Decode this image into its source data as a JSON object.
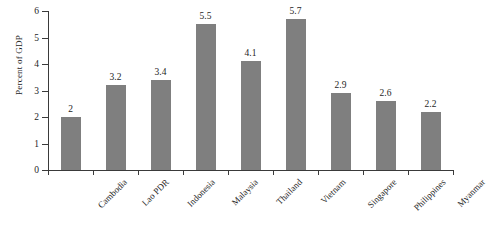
{
  "chart_data": {
    "type": "bar",
    "title": "",
    "subtitle": "",
    "xlabel": "",
    "ylabel": "Percent of GDP",
    "ylim": [
      0,
      6
    ],
    "ytick_labels": [
      "0",
      "1",
      "2",
      "3",
      "4",
      "5",
      "6"
    ],
    "yticks": [
      0,
      1,
      2,
      3,
      4,
      5,
      6
    ],
    "grid": false,
    "legend": null,
    "bar_color": "#7f7f7f",
    "axis_color": "#3a3a3a",
    "background": "#ffffff",
    "value_labels_shown": true,
    "categories": [
      "Cambodia",
      "Lao PDR",
      "Indonesia",
      "Malaysia",
      "Thailand",
      "Vietnam",
      "Singapore",
      "Philippines",
      "Myanmar"
    ],
    "values": [
      2,
      3.2,
      3.4,
      5.5,
      4.1,
      5.7,
      2.9,
      2.6,
      2.2
    ],
    "value_label_text": [
      "2",
      "3.2",
      "3.4",
      "5.5",
      "4.1",
      "5.7",
      "2.9",
      "2.6",
      "2.2"
    ]
  }
}
